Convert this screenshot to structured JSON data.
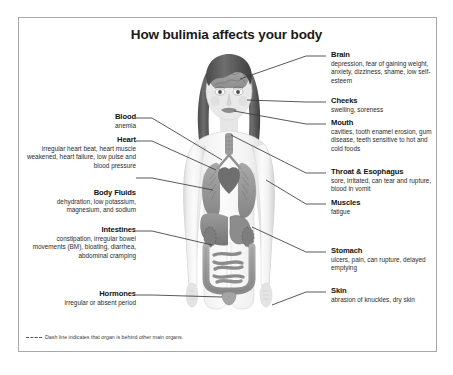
{
  "poster": {
    "title": "How bulimia affects your body",
    "footnote": "Dash line indicates that organ is behind other main organs.",
    "footnote_marker": "dashed-line-swatch",
    "border_color": "#a9a9a9",
    "background_color": "#ffffff",
    "text_color": "#2b2b2b",
    "heading_color": "#111111",
    "leader_line_color": "#3c3c3c"
  },
  "figure": {
    "name": "human-body-anatomy-illustration",
    "organs": [
      "brain",
      "face",
      "mouth",
      "trachea",
      "lungs",
      "heart",
      "esophagus",
      "liver",
      "stomach",
      "kidneys",
      "small intestine",
      "large intestine",
      "bladder"
    ]
  },
  "left_labels": [
    {
      "id": "blood",
      "heading": "Blood",
      "body": "anemia"
    },
    {
      "id": "heart",
      "heading": "Heart",
      "body": "irregular heart beat, heart muscle weakened, heart failure, low pulse and blood pressure"
    },
    {
      "id": "body-fluids",
      "heading": "Body Fluids",
      "body": "dehydration, low potassium, magnesium, and sodium"
    },
    {
      "id": "intestines",
      "heading": "Intestines",
      "body": "constipation, irregular bowel movements (BM), bloating, diarrhea, abdominal cramping"
    },
    {
      "id": "hormones",
      "heading": "Hormones",
      "body": "irregular or absent period"
    }
  ],
  "right_labels": [
    {
      "id": "brain",
      "heading": "Brain",
      "body": "depression, fear of gaining weight, anxiety, dizziness, shame, low self-esteem"
    },
    {
      "id": "cheeks",
      "heading": "Cheeks",
      "body": "swelling, soreness"
    },
    {
      "id": "mouth",
      "heading": "Mouth",
      "body": "cavities, tooth enamel erosion, gum disease, teeth sensitive to hot and cold foods"
    },
    {
      "id": "throat-esophagus",
      "heading": "Throat & Esophagus",
      "body": "sore, irritated, can tear and rupture, blood in vomit"
    },
    {
      "id": "muscles",
      "heading": "Muscles",
      "body": "fatigue"
    },
    {
      "id": "stomach",
      "heading": "Stomach",
      "body": "ulcers, pain, can rupture, delayed emptying"
    },
    {
      "id": "skin",
      "heading": "Skin",
      "body": "abrasion of knuckles, dry skin"
    }
  ]
}
